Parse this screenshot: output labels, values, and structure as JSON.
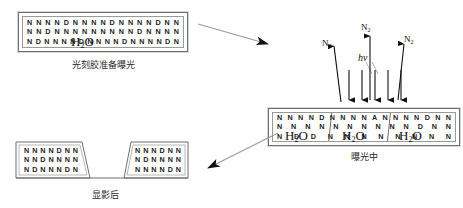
{
  "diagram": {
    "background_color": "#ffffff",
    "line_color": "#6f6f6f",
    "text_color": "#1b1b1b"
  },
  "stage_prepare": {
    "caption": "光刻胶准备曝光",
    "lattice_rows": [
      [
        "N",
        "N",
        "N",
        "N",
        "D",
        "N",
        "N",
        "N",
        "N",
        "D",
        "N",
        "N",
        "N",
        "N",
        "D",
        "N",
        "N"
      ],
      [
        "N",
        "N",
        "D",
        "N",
        "N",
        "N",
        "N",
        "N",
        "N",
        "N",
        "N",
        "N",
        "D",
        "N",
        "N",
        "N",
        "N"
      ],
      [
        "N",
        "D",
        "N",
        "N",
        "N",
        "N",
        "D",
        "N",
        "N",
        "N",
        "N",
        "D",
        "N",
        "N",
        "N",
        "N",
        "D",
        "N"
      ]
    ],
    "formula": "H2O",
    "formula_html": "H<sub>2</sub>O"
  },
  "stage_exposing": {
    "caption": "曝光中",
    "segments": [
      {
        "lattice_rows": [
          [
            "N",
            "N",
            "N",
            "N",
            "D",
            "N",
            "N"
          ],
          [
            "N",
            "N",
            "N",
            "N",
            "N",
            "N",
            "N"
          ],
          [
            "N",
            "D",
            "H",
            "2",
            "O",
            "D",
            "N"
          ]
        ],
        "formula_html": "H<sub>2</sub>O"
      },
      {
        "lattice_rows": [
          [
            "N",
            "N",
            "A",
            "N",
            "N"
          ],
          [
            "N",
            "N",
            "N",
            "N",
            "N"
          ],
          [
            "N",
            "N",
            "A",
            "N",
            "N"
          ]
        ],
        "formula_html": "H<sub>2</sub>O"
      },
      {
        "lattice_rows": [
          [
            "N",
            "N",
            "N",
            "D",
            "N",
            "N"
          ],
          [
            "N",
            "D",
            "N",
            "N",
            "N",
            "I",
            "N"
          ],
          [
            "N",
            "N",
            "N",
            "N",
            "J",
            "N"
          ]
        ],
        "formula_html": "H<sub>2</sub>O"
      }
    ],
    "row_top": [
      "N",
      "N",
      "N",
      "N",
      "D",
      "N",
      "N",
      "N",
      "N",
      "A",
      "N",
      "N",
      "N",
      "N",
      "D",
      "N",
      "N"
    ],
    "row_mid": [
      "N",
      "N",
      "N",
      "N",
      "N",
      "N",
      "N",
      "N",
      "N",
      "N",
      "D",
      "N",
      "N"
    ],
    "row_bot": [
      "N",
      "D",
      "D",
      "N",
      "N",
      "N",
      "N",
      "N",
      "N",
      "N",
      "N"
    ]
  },
  "stage_developed": {
    "caption": "显影后",
    "left_block_rows": [
      [
        "N",
        "N",
        "N",
        "N",
        "D",
        "N",
        "N"
      ],
      [
        "N",
        "N",
        "D",
        "N",
        "N",
        "N",
        "N"
      ],
      [
        "N",
        "D",
        "N",
        "N",
        "N",
        "D",
        "N"
      ]
    ],
    "right_block_rows": [
      [
        "N",
        "N",
        "N",
        "D",
        "N",
        "N"
      ],
      [
        "N",
        "D",
        "N",
        "N",
        "N",
        "N"
      ],
      [
        "N",
        "N",
        "N",
        "N",
        "D",
        "N"
      ]
    ]
  },
  "photon_annotation": {
    "hv_label": "hv",
    "n2_labels": [
      "N2",
      "N2",
      "N2"
    ],
    "n2_label_html": "N<sub>2</sub>",
    "down_arrow_count": 5,
    "up_arrow_count": 3
  },
  "flow_arrows": [
    {
      "name": "prepare-to-exposing",
      "direction": "down-right"
    },
    {
      "name": "exposing-to-developed",
      "direction": "down-left"
    }
  ]
}
